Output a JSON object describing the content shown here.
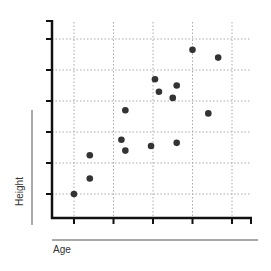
{
  "chart_data": {
    "type": "scatter",
    "title": "",
    "xlabel": "Age",
    "ylabel": "Height",
    "xlim": [
      0,
      5
    ],
    "ylim": [
      0,
      6
    ],
    "grid": true,
    "legend": null,
    "x_ticks": [
      0,
      1,
      2,
      3,
      4
    ],
    "y_ticks": [
      0,
      1,
      2,
      3,
      4,
      5
    ],
    "x_tick_labels": [],
    "y_tick_labels": [],
    "points": [
      {
        "x": 0.0,
        "y": 0.0
      },
      {
        "x": 0.4,
        "y": 0.5
      },
      {
        "x": 0.4,
        "y": 1.25
      },
      {
        "x": 1.2,
        "y": 1.75
      },
      {
        "x": 1.3,
        "y": 1.4
      },
      {
        "x": 1.3,
        "y": 2.7
      },
      {
        "x": 1.95,
        "y": 1.55
      },
      {
        "x": 2.05,
        "y": 3.7
      },
      {
        "x": 2.15,
        "y": 3.3
      },
      {
        "x": 2.5,
        "y": 3.1
      },
      {
        "x": 2.6,
        "y": 3.5
      },
      {
        "x": 2.6,
        "y": 1.65
      },
      {
        "x": 3.0,
        "y": 4.65
      },
      {
        "x": 3.4,
        "y": 2.6
      },
      {
        "x": 3.65,
        "y": 4.4
      }
    ],
    "colors": {
      "points": "#333333",
      "axis": "#111111",
      "grid": "#aaaaaa",
      "label_rule": "#555555"
    }
  },
  "labels": {
    "x_axis": "Age",
    "y_axis": "Height"
  }
}
